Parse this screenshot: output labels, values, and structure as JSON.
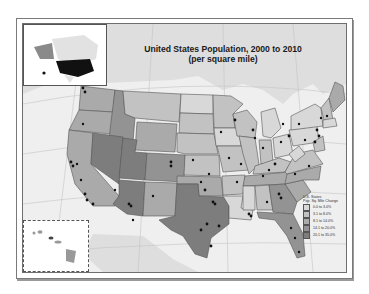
{
  "map": {
    "title_line1": "United States Population, 2000 to 2010",
    "title_line2": "(per square mile)",
    "legend": {
      "heading": "U.S. States",
      "subheading": "Pop. Sq. Mile Change",
      "classes": [
        {
          "label": "0.0 to 3.0%",
          "color": "#d8d8d8"
        },
        {
          "label": "3.1 to 8.0%",
          "color": "#c2c2c2"
        },
        {
          "label": "8.1 to 14.0%",
          "color": "#aaaaaa"
        },
        {
          "label": "14.1 to 20.0%",
          "color": "#939393"
        },
        {
          "label": "20.1 to 35.0%",
          "color": "#7d7d7d"
        }
      ]
    },
    "insets": [
      "Alaska / North America locator",
      "Hawaii"
    ],
    "colors": {
      "ocean": "#efefef",
      "land_other": "#dedede",
      "state_border": "#555555",
      "city_dot": "#111111",
      "graticule": "#b8b8b8"
    }
  }
}
